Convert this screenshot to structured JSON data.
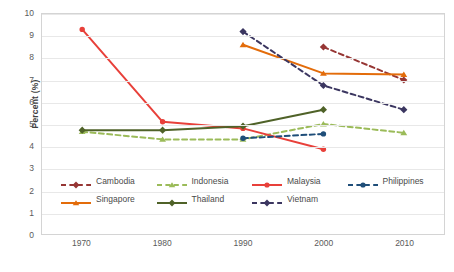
{
  "chart_data": {
    "type": "line",
    "title": "",
    "subtitle": "",
    "xlabel": "",
    "ylabel": "Percent (%)",
    "x": [
      1970,
      1980,
      1990,
      2000,
      2010
    ],
    "categories": [
      "1970",
      "1980",
      "1990",
      "2000",
      "2010"
    ],
    "xlim": [
      1965,
      2015
    ],
    "ylim": [
      0,
      10
    ],
    "ytick_labels": [
      "0",
      "1",
      "2",
      "3",
      "4",
      "5",
      "6",
      "7",
      "8",
      "9",
      "10"
    ],
    "ytick_values": [
      0,
      1,
      2,
      3,
      4,
      5,
      6,
      7,
      8,
      9,
      10
    ],
    "grid": "horizontal",
    "legend_position": "inside-bottom-left",
    "series": [
      {
        "name": "Cambodia",
        "color": "#963634",
        "style": "dashed",
        "marker": "diamond",
        "x": [
          2000,
          2010
        ],
        "values": [
          8.5,
          7.0
        ]
      },
      {
        "name": "Indonesia",
        "color": "#9BBB59",
        "style": "dashed",
        "marker": "triangle",
        "x": [
          1970,
          1980,
          1990,
          2000,
          2010
        ],
        "values": [
          4.65,
          4.3,
          4.3,
          5.0,
          4.6
        ]
      },
      {
        "name": "Malaysia",
        "color": "#E8403A",
        "style": "solid",
        "marker": "circle",
        "x": [
          1970,
          1980,
          1990,
          2000
        ],
        "values": [
          9.3,
          5.1,
          4.8,
          3.85
        ]
      },
      {
        "name": "Philippines",
        "color": "#1F4E79",
        "style": "dashed",
        "marker": "circle",
        "x": [
          1990,
          2000
        ],
        "values": [
          4.35,
          4.55
        ]
      },
      {
        "name": "Singapore",
        "color": "#E36C0A",
        "style": "solid",
        "marker": "triangle",
        "x": [
          1990,
          2000,
          2010
        ],
        "values": [
          8.6,
          7.3,
          7.25
        ]
      },
      {
        "name": "Thailand",
        "color": "#4F6228",
        "style": "solid",
        "marker": "diamond",
        "x": [
          1970,
          1980,
          1990,
          2000
        ],
        "values": [
          4.72,
          4.72,
          4.9,
          5.65
        ]
      },
      {
        "name": "Vietnam",
        "color": "#3B3660",
        "style": "dashed",
        "marker": "diamond",
        "x": [
          1990,
          2000,
          2010
        ],
        "values": [
          9.2,
          6.75,
          5.65
        ]
      }
    ]
  },
  "legend": {
    "items": [
      {
        "label": "Cambodia"
      },
      {
        "label": "Indonesia"
      },
      {
        "label": "Malaysia"
      },
      {
        "label": "Philippines"
      },
      {
        "label": "Singapore"
      },
      {
        "label": "Thailand"
      },
      {
        "label": "Vietnam"
      }
    ]
  }
}
